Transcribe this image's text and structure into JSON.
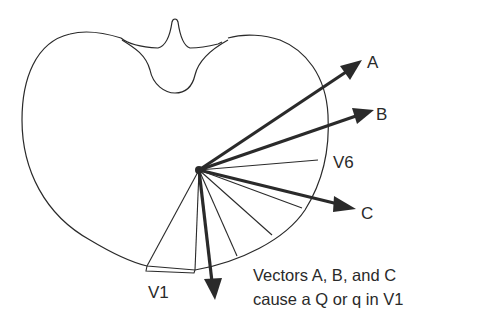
{
  "diagram": {
    "colors": {
      "ink": "#2a2a2a",
      "background": "#ffffff"
    },
    "vectors": [
      {
        "id": "A",
        "label": "A"
      },
      {
        "id": "B",
        "label": "B"
      },
      {
        "id": "C",
        "label": "C"
      }
    ],
    "leads": {
      "v1": {
        "label": "V1"
      },
      "v6": {
        "label": "V6"
      }
    },
    "caption": {
      "line1": "Vectors A, B, and C",
      "line2": "cause a Q or q in V1"
    }
  }
}
